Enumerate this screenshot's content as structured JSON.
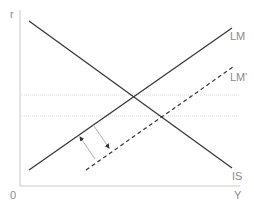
{
  "diagram": {
    "axes": {
      "y_label": "r",
      "x_label": "Y",
      "origin_label": "0"
    },
    "curves": [
      {
        "name": "IS",
        "label": "IS",
        "style": "solid"
      },
      {
        "name": "LM",
        "label": "LM",
        "style": "solid"
      },
      {
        "name": "LM_prime",
        "label": "LM'",
        "style": "dashed"
      }
    ],
    "reference_lines": [
      {
        "name": "r_initial",
        "style": "dotted"
      },
      {
        "name": "r_new",
        "style": "dotted"
      }
    ],
    "arrows": [
      {
        "name": "shift-left-arrow",
        "direction": "up-left"
      },
      {
        "name": "shift-right-arrow",
        "direction": "down-right"
      }
    ],
    "colors": {
      "axis": "#c8c8c8",
      "curve": "#333333",
      "label": "#8a8a8a",
      "dotted": "#d0d0d0",
      "arrow": "#9a9a9a"
    }
  }
}
